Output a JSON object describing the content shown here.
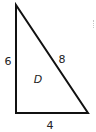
{
  "diagram": {
    "type": "right-triangle",
    "shape_label": "D",
    "sides": {
      "left_vertical": "6",
      "hypotenuse": "8",
      "bottom_horizontal": "4"
    },
    "vertices": {
      "top": [
        16,
        5
      ],
      "bottom_left": [
        16,
        113
      ],
      "bottom_right": [
        88,
        113
      ]
    },
    "stroke_color": "#111111",
    "label_color": "#222222"
  }
}
